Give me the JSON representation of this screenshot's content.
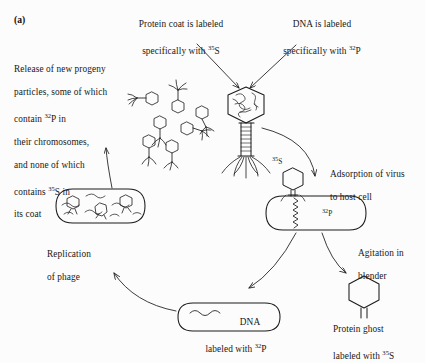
{
  "panel": {
    "label": "(a)",
    "background_color": "#fcfcfc",
    "ink_color": "#1a1a1a"
  },
  "title_callouts": {
    "protein_coat": {
      "line1": "Protein coat is labeled",
      "line2_prefix": "specifically with ",
      "isotope": "35S",
      "isotope_sup": "35",
      "isotope_element": "S"
    },
    "dna": {
      "line1": "DNA is labeled",
      "line2_prefix": "specifically with ",
      "isotope": "32P",
      "isotope_sup": "32",
      "isotope_element": "P"
    }
  },
  "release_text": {
    "line1": "Release of new progeny",
    "line2": "particles, some of which",
    "line3_prefix": "contain ",
    "line3_sup": "32",
    "line3_element": "P",
    "line3_suffix": " in",
    "line4": "their chromosomes,",
    "line5": "and none of which",
    "line6_prefix": "contains ",
    "line6_sup": "35",
    "line6_element": "S",
    "line6_suffix": " in",
    "line7": "its coat"
  },
  "stage_labels": {
    "adsorption": {
      "line1": "Adsorption of virus",
      "line2": "to host cell"
    },
    "agitation": {
      "line1": "Agitation in",
      "line2": "blender"
    },
    "protein_ghost": {
      "line1": "Protein ghost",
      "line2_prefix": "labeled with ",
      "line2_sup": "35",
      "line2_element": "S"
    },
    "dna_capsule": {
      "line1": "DNA",
      "line2_prefix": "labeled with ",
      "line2_sup": "32",
      "line2_element": "P"
    },
    "replication": {
      "line1": "Replication",
      "line2": "of phage"
    }
  },
  "inline_isotopes": {
    "phage_head_s35_sup": "35",
    "phage_head_s35_element": "S",
    "injected_dna_p32_sup": "32",
    "injected_dna_p32_element": "P"
  },
  "figure_elements": {
    "main_phage": "bacteriophage with hexagonal head, striped contractile tail and splayed tail fibers",
    "progeny_cluster_count": 7,
    "host_cell": "rod-shaped bacterium (capsule outline)",
    "ghost": "empty hexagonal capsid with short tail stub",
    "dna_capsule": "rounded capsule containing wavy DNA strand",
    "replication_cell": "rod-shaped bacterium containing assembling phage heads and DNA squiggles"
  }
}
